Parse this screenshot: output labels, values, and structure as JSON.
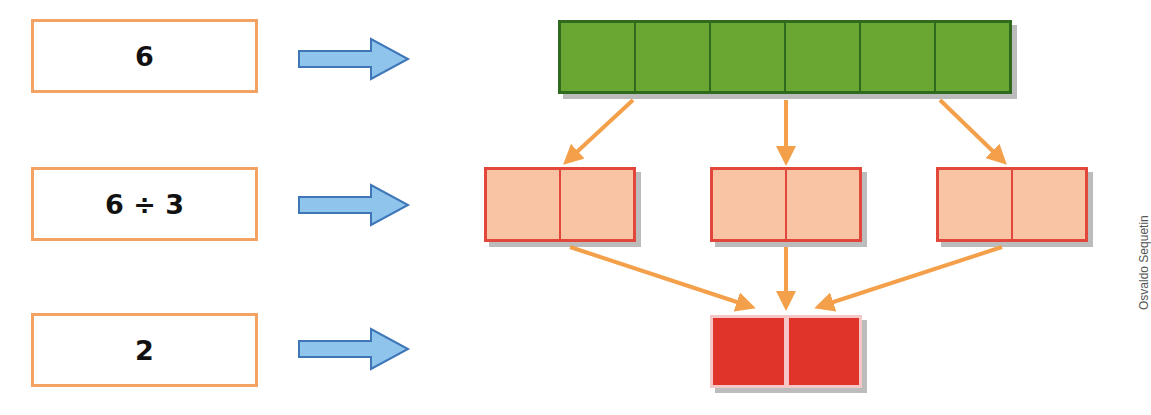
{
  "rows": [
    {
      "label": "6",
      "description": "six green units"
    },
    {
      "label": "6 ÷ 3",
      "description": "split into three groups of two"
    },
    {
      "label": "2",
      "description": "each group has two units"
    }
  ],
  "diagram": {
    "total_units": 6,
    "divisor": 3,
    "quotient": 2,
    "colors": {
      "label_border": "#f4a261",
      "blue_arrow_fill": "#8fc4ec",
      "blue_arrow_stroke": "#3f76b8",
      "green_unit": "#6aa632",
      "green_border": "#2f6b1e",
      "pink_unit": "#f8c4a4",
      "pink_border": "#e2473b",
      "red_unit": "#e0342a",
      "orange_arrow": "#f4a04a"
    },
    "icons": [
      "right-arrow-icon",
      "down-arrow-icon"
    ]
  },
  "credit": "Osvaldo Sequetin"
}
